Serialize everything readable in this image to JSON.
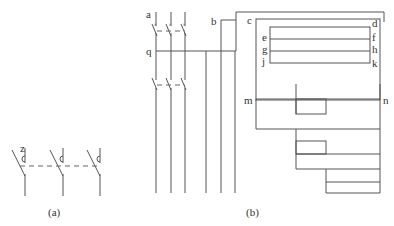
{
  "panel_a": {
    "caption": "(a)",
    "labels": {
      "z": "z"
    },
    "poles": 3
  },
  "panel_b": {
    "caption": "(b)",
    "labels": {
      "a": "a",
      "b": "b",
      "c": "c",
      "d": "d",
      "e": "e",
      "f": "f",
      "g": "g",
      "h": "h",
      "j": "j",
      "k": "k",
      "q": "q",
      "m": "m",
      "n": "n"
    },
    "poles": 3
  },
  "colors": {
    "line": "#555555",
    "text": "#333333",
    "background": "#ffffff"
  }
}
